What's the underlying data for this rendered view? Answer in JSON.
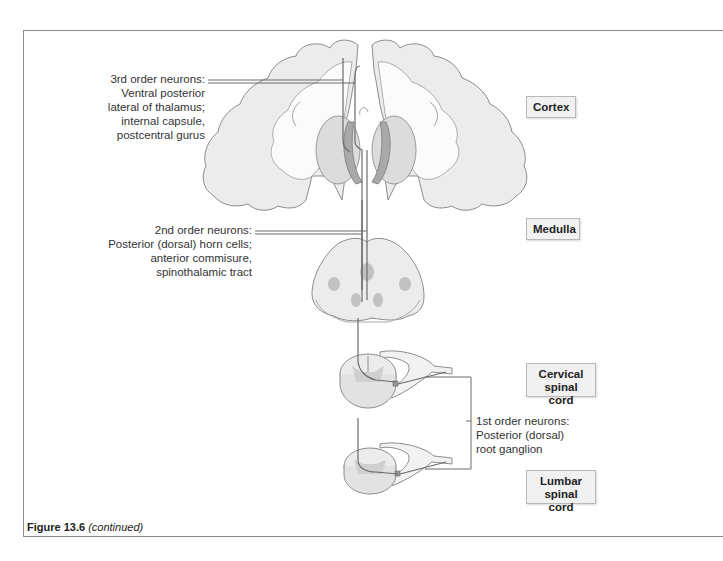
{
  "figure": {
    "caption_number": "Figure 13.6",
    "caption_note": "(continued)"
  },
  "levels": {
    "cortex": "Cortex",
    "medulla": "Medulla",
    "cervical_line1": "Cervical",
    "cervical_line2": "spinal cord",
    "lumbar_line1": "Lumbar",
    "lumbar_line2": "spinal cord"
  },
  "neurons": {
    "third_order": {
      "lines": [
        "3rd order neurons:",
        "Ventral posterior",
        "lateral of thalamus;",
        "internal capsule,",
        "postcentral gurus"
      ]
    },
    "second_order": {
      "lines": [
        "2nd order neurons:",
        "Posterior (dorsal) horn cells;",
        "anterior commisure,",
        "spinothalamic tract"
      ]
    },
    "first_order": {
      "lines": [
        "1st order neurons:",
        "Posterior (dorsal)",
        "root ganglion"
      ]
    }
  },
  "colors": {
    "tissue_fill": "#ececec",
    "tissue_stroke": "#8c8c8c",
    "gray_matter": "#c8c8c8",
    "internal_capsule": "#a9a9a9",
    "pathway": "#6b6b6b"
  }
}
